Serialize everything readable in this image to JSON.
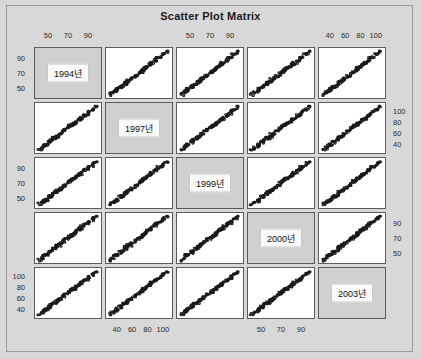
{
  "title": "Scatter Plot Matrix",
  "chart_data": {
    "type": "scatter",
    "title": "Scatter Plot Matrix",
    "layout": "scatter-plot-matrix",
    "grid": [
      5,
      5
    ],
    "grid_on": false,
    "legend": "none",
    "variables": [
      "1994년",
      "1997년",
      "1999년",
      "2000년",
      "2003년"
    ],
    "diagonal_labels": [
      "1994년",
      "1997년",
      "1999년",
      "2000년",
      "2003년"
    ],
    "axis_ticks": {
      "top": [
        {
          "col": 1,
          "ticks": [
            50,
            70,
            90
          ]
        },
        {
          "col": 3,
          "ticks": [
            50,
            70,
            90
          ]
        },
        {
          "col": 5,
          "ticks": [
            40,
            60,
            80,
            100
          ]
        }
      ],
      "bottom": [
        {
          "col": 2,
          "ticks": [
            40,
            60,
            80,
            100
          ]
        },
        {
          "col": 4,
          "ticks": [
            50,
            70,
            90
          ]
        }
      ],
      "left": [
        {
          "row": 1,
          "ticks": [
            90,
            70,
            50
          ]
        },
        {
          "row": 3,
          "ticks": [
            90,
            70,
            50
          ]
        },
        {
          "row": 5,
          "ticks": [
            100,
            80,
            60,
            40
          ]
        }
      ],
      "right": [
        {
          "row": 2,
          "ticks": [
            100,
            80,
            60,
            40
          ]
        },
        {
          "row": 4,
          "ticks": [
            90,
            70,
            50
          ]
        }
      ]
    },
    "axis_ranges": [
      {
        "variable": "1994년",
        "min": 40,
        "max": 100
      },
      {
        "variable": "1997년",
        "min": 30,
        "max": 108
      },
      {
        "variable": "1999년",
        "min": 40,
        "max": 100
      },
      {
        "variable": "2000년",
        "min": 40,
        "max": 100
      },
      {
        "variable": "2003년",
        "min": 30,
        "max": 108
      }
    ],
    "relationship": "strong positive correlation in all off-diagonal panels",
    "point_style": "open circle",
    "point_color": "#1a1a1a",
    "n_points": 120,
    "points": [
      [
        52,
        50,
        53,
        51,
        48
      ],
      [
        55,
        53,
        56,
        55,
        52
      ],
      [
        58,
        57,
        59,
        58,
        56
      ],
      [
        60,
        59,
        61,
        60,
        58
      ],
      [
        62,
        61,
        63,
        62,
        60
      ],
      [
        64,
        63,
        65,
        64,
        62
      ],
      [
        66,
        65,
        67,
        66,
        64
      ],
      [
        68,
        67,
        69,
        68,
        66
      ],
      [
        70,
        69,
        71,
        70,
        68
      ],
      [
        72,
        71,
        73,
        72,
        70
      ],
      [
        74,
        73,
        75,
        74,
        72
      ],
      [
        76,
        75,
        77,
        76,
        74
      ],
      [
        78,
        77,
        79,
        78,
        76
      ],
      [
        80,
        79,
        81,
        80,
        78
      ],
      [
        82,
        81,
        83,
        82,
        80
      ],
      [
        84,
        83,
        85,
        84,
        82
      ],
      [
        86,
        85,
        87,
        86,
        84
      ],
      [
        88,
        87,
        89,
        88,
        86
      ],
      [
        90,
        89,
        91,
        90,
        88
      ],
      [
        92,
        91,
        93,
        92,
        90
      ]
    ]
  },
  "colors": {
    "background": "#d8d8d8",
    "panel": "#ffffff",
    "diagonal_panel": "#d0d0d0",
    "border": "#5b5b5b",
    "point": "#1a1a1a",
    "text": "#1a1a1a"
  }
}
